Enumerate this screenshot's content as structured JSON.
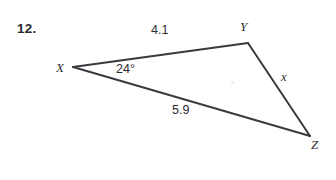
{
  "page": {
    "background_color": "#ffffff",
    "ink_color": "#2b2b2f",
    "width": 336,
    "height": 180
  },
  "problem": {
    "number_label": "12.",
    "number_x": 17,
    "number_y": 22
  },
  "figure": {
    "type": "triangle",
    "stroke_color": "#3a3a40",
    "stroke_width": 2,
    "vertices": [
      {
        "name": "X",
        "x": 73,
        "y": 67,
        "label": "X",
        "label_x": 56,
        "label_y": 61
      },
      {
        "name": "Y",
        "x": 248,
        "y": 43,
        "label": "Y",
        "label_x": 240,
        "label_y": 20
      },
      {
        "name": "Z",
        "x": 310,
        "y": 136,
        "label": "Z",
        "label_x": 311,
        "label_y": 138
      }
    ],
    "edges": [
      {
        "name": "XY",
        "from": "X",
        "to": "Y"
      },
      {
        "name": "YZ",
        "from": "Y",
        "to": "Z"
      },
      {
        "name": "XZ",
        "from": "X",
        "to": "Z"
      }
    ],
    "side_labels": [
      {
        "name": "side-xy-length",
        "text": "4.1",
        "x": 151,
        "y": 24
      },
      {
        "name": "side-xz-length",
        "text": "5.9",
        "x": 172,
        "y": 104
      },
      {
        "name": "side-yz-unknown",
        "text": "x",
        "x": 281,
        "y": 71
      }
    ],
    "angle_labels": [
      {
        "name": "angle-x",
        "text": "24°",
        "x": 116,
        "y": 63,
        "vertex": "X",
        "value": 24,
        "unit": "degrees"
      }
    ]
  }
}
